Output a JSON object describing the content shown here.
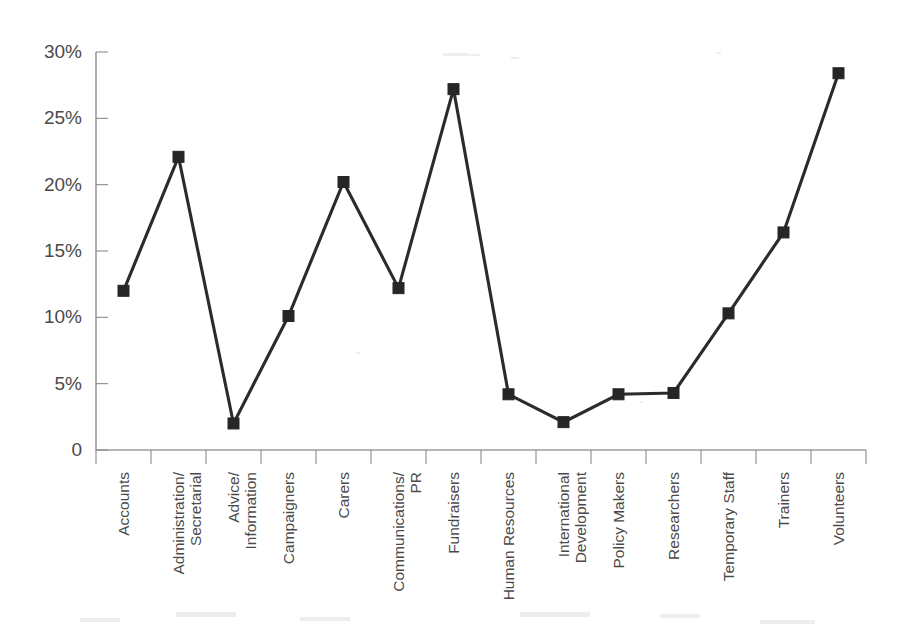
{
  "chart_data": {
    "type": "line",
    "title": "",
    "subtitle": "",
    "xlabel": "",
    "ylabel": "",
    "categories": [
      "Accounts",
      "Administration/ Secretarial",
      "Advice/ Information",
      "Campaigners",
      "Carers",
      "Communications/ PR",
      "Fundraisers",
      "Human Resources",
      "International Development",
      "Policy Makers",
      "Researchers",
      "Temporary Staff",
      "Trainers",
      "Volunteers"
    ],
    "category_lines": [
      [
        "Accounts"
      ],
      [
        "Administration/",
        "Secretarial"
      ],
      [
        "Advice/",
        "Information"
      ],
      [
        "Campaigners"
      ],
      [
        "Carers"
      ],
      [
        "Communications/",
        "PR"
      ],
      [
        "Fundraisers"
      ],
      [
        "Human Resources"
      ],
      [
        "International",
        "Development"
      ],
      [
        "Policy Makers"
      ],
      [
        "Researchers"
      ],
      [
        "Temporary Staff"
      ],
      [
        "Trainers"
      ],
      [
        "Volunteers"
      ]
    ],
    "values": [
      12.0,
      22.1,
      2.0,
      10.1,
      20.2,
      12.2,
      27.2,
      4.2,
      2.1,
      4.2,
      4.3,
      10.3,
      16.4,
      28.4
    ],
    "ylim": [
      0,
      30
    ],
    "ytick_values": [
      0,
      5,
      10,
      15,
      20,
      25,
      30
    ],
    "ytick_labels": [
      "0",
      "5%",
      "10%",
      "15%",
      "20%",
      "25%",
      "30%"
    ],
    "grid": false,
    "legend": null,
    "legend_position": "none",
    "marker": "square",
    "line_color": "#262626",
    "marker_color": "#262626",
    "axis_color": "#6e6e6e",
    "background_color": "#ffffff"
  }
}
